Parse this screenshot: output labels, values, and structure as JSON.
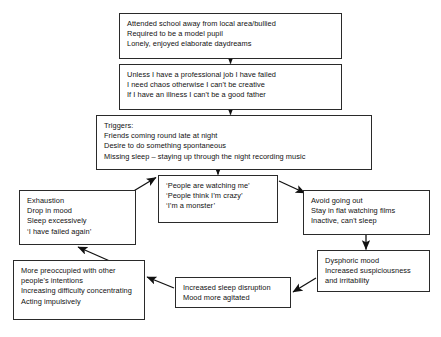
{
  "diagram": {
    "type": "flowchart",
    "title": "",
    "style": {
      "box_border": "#2a2a2a",
      "box_fill": "#ffffff",
      "arrow": "#111111",
      "text": "#111111"
    },
    "nodes": [
      {
        "id": "school",
        "name": "early-experiences-box",
        "lines": [
          "Attended school away from local area/bullied",
          "Required to be a model pupil",
          "Lonely, enjoyed elaborate daydreams"
        ]
      },
      {
        "id": "assumptions",
        "name": "dysfunctional-assumptions-box",
        "lines": [
          "Unless I have a professional job I have failed",
          "I need chaos otherwise I can't be creative",
          "If I have an illness I can't be a good father"
        ]
      },
      {
        "id": "triggers",
        "name": "triggers-box",
        "lines": [
          "Triggers:",
          "Friends coming round late at night",
          "Desire to do something spontaneous",
          "Missing sleep – staying up through the night recording music"
        ]
      },
      {
        "id": "thoughts",
        "name": "negative-thoughts-box",
        "lines": [
          "‘People are watching me’",
          "‘People think I’m crazy’",
          "‘I’m a monster’"
        ]
      },
      {
        "id": "exhaustion",
        "name": "exhaustion-box",
        "lines": [
          "Exhaustion",
          "Drop in mood",
          "Sleep excessively",
          "‘I have failed again’"
        ]
      },
      {
        "id": "avoid",
        "name": "avoidance-behaviour-box",
        "lines": [
          "Avoid going out",
          "Stay in flat watching films",
          "Inactive, can't sleep"
        ]
      },
      {
        "id": "dysphoric",
        "name": "dysphoric-mood-box",
        "lines": [
          "Dysphoric mood",
          "Increased suspiciousness",
          "and irritability"
        ]
      },
      {
        "id": "sleepdisrupt",
        "name": "sleep-disruption-box",
        "lines": [
          "Increased sleep disruption",
          "Mood more agitated"
        ]
      },
      {
        "id": "preoccupied",
        "name": "preoccupation-box",
        "lines": [
          "More preoccupied with other",
          "people's intentions",
          "Increasing difficulty concentrating",
          "Acting impulsively"
        ]
      }
    ],
    "edges": [
      {
        "from": "school",
        "to": "assumptions",
        "kind": "vertical-down"
      },
      {
        "from": "assumptions",
        "to": "triggers",
        "kind": "vertical-down"
      },
      {
        "from": "triggers",
        "to": "thoughts",
        "kind": "vertical-down"
      },
      {
        "from": "exhaustion",
        "to": "thoughts",
        "kind": "diagonal-up-right"
      },
      {
        "from": "thoughts",
        "to": "avoid",
        "kind": "diagonal-down-right"
      },
      {
        "from": "avoid",
        "to": "dysphoric",
        "kind": "vertical-down"
      },
      {
        "from": "dysphoric",
        "to": "sleepdisrupt",
        "kind": "diagonal-down-left"
      },
      {
        "from": "sleepdisrupt",
        "to": "preoccupied",
        "kind": "diagonal-left"
      },
      {
        "from": "preoccupied",
        "to": "exhaustion",
        "kind": "diagonal-up-left"
      }
    ]
  }
}
